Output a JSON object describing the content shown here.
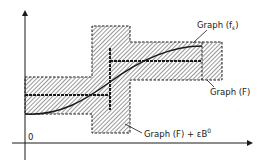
{
  "diagram": {
    "colors": {
      "ink": "#1a1a1a",
      "paper": "#ffffff"
    },
    "axes": {
      "origin_label": "0"
    },
    "labels": {
      "graph_f_eps": "Graph (f",
      "graph_f_eps_sub": "ε",
      "graph_f_eps_close": ")",
      "graph_F": "Graph (F)",
      "graph_F_neighborhood": "Graph (F) + εB",
      "graph_F_neighborhood_sup": "0"
    }
  }
}
